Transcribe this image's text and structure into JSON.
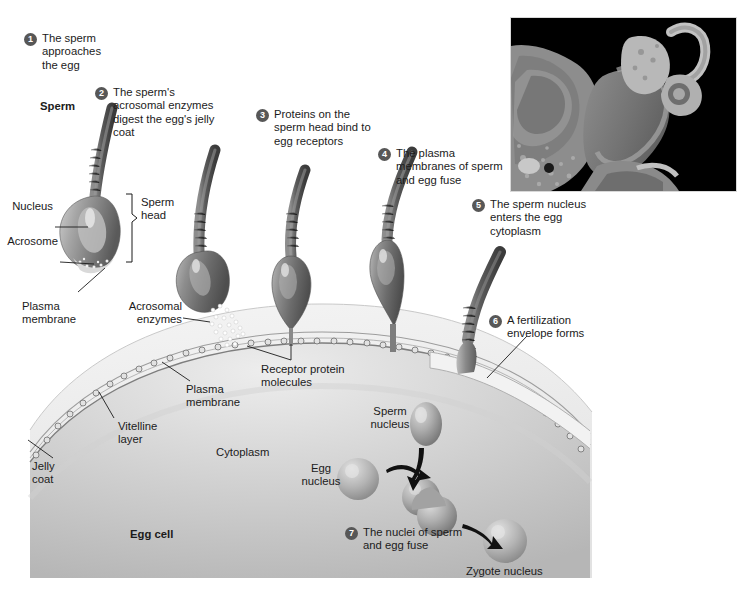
{
  "figure": {
    "title_visible": false,
    "background_color": "#ffffff",
    "badge_color": "#575757",
    "cytoplasm_color": "#c8c8c8",
    "jelly_coat_color": "#e6e6e6"
  },
  "steps": [
    {
      "number": "1",
      "text": "The sperm approaches the egg"
    },
    {
      "number": "2",
      "text": "The sperm's acrosomal enzymes digest the egg's jelly coat"
    },
    {
      "number": "3",
      "text": "Proteins on the sperm head bind to egg receptors"
    },
    {
      "number": "4",
      "text": "The plasma membranes of sperm and egg fuse"
    },
    {
      "number": "5",
      "text": "The sperm nucleus enters the egg cytoplasm"
    },
    {
      "number": "6",
      "text": "A fertilization envelope forms"
    },
    {
      "number": "7",
      "text": "The nuclei of sperm and egg fuse"
    }
  ],
  "labels": {
    "sperm": "Sperm",
    "nucleus": "Nucleus",
    "acrosome": "Acrosome",
    "plasma_membrane_sperm": "Plasma membrane",
    "sperm_head": "Sperm head",
    "acrosomal_enzymes": "Acrosomal enzymes",
    "receptor_protein_molecules": "Receptor protein molecules",
    "plasma_membrane_egg": "Plasma membrane",
    "vitelline_layer": "Vitelline layer",
    "jelly_coat": "Jelly coat",
    "cytoplasm": "Cytoplasm",
    "egg_cell": "Egg cell",
    "sperm_nucleus": "Sperm nucleus",
    "egg_nucleus": "Egg nucleus",
    "zygote_nucleus": "Zygote nucleus"
  },
  "micrograph": {
    "present": true,
    "type": "transmission-electron-micrograph",
    "background_color": "#000000"
  }
}
